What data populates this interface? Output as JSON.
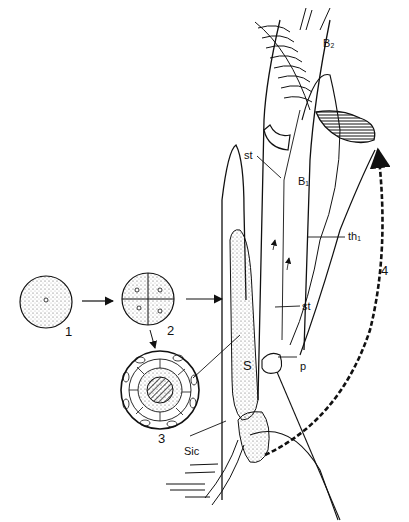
{
  "figure": {
    "stages": [
      {
        "id": "1",
        "label": "1",
        "description": "single cell (zygote)"
      },
      {
        "id": "2",
        "label": "2",
        "description": "four-cell stage"
      },
      {
        "id": "3",
        "label": "3",
        "description": "cross-section of multicellular body"
      },
      {
        "id": "4",
        "label": "4",
        "description": "dispersal path (dashed arrow)"
      }
    ],
    "labels": {
      "B2": "B₂",
      "B1": "B₁",
      "st_upper": "st",
      "st_lower": "st",
      "th1": "th₁",
      "S": "S",
      "p": "p",
      "Sic": "Sic"
    },
    "colors": {
      "ink": "#111111",
      "background": "#ffffff",
      "stipple": "#555555"
    }
  }
}
